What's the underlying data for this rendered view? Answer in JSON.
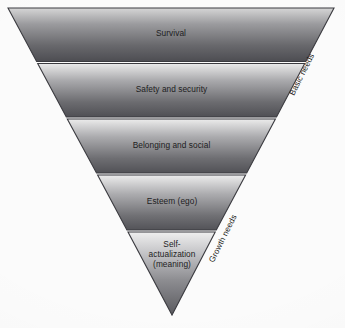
{
  "diagram": {
    "name": "inverted-hierarchy-of-needs",
    "type": "inverted-triangle-pyramid",
    "background_color": "#fbfbfb",
    "outline_color": "#3b3b40",
    "label_color": "#1d1d22",
    "band_gradient_light": "#ebebeb",
    "band_gradient_dark": "#4a4a4f",
    "bands": [
      {
        "id": "survival",
        "label": "Survival",
        "level": 1,
        "group": "Basic needs",
        "lines": [
          "Survival"
        ]
      },
      {
        "id": "safety-and-security",
        "label": "Safety and security",
        "level": 2,
        "group": "Basic needs",
        "lines": [
          "Safety and security"
        ]
      },
      {
        "id": "belonging-and-social",
        "label": "Belonging and social",
        "level": 3,
        "group": "Basic needs",
        "lines": [
          "Belonging and social"
        ]
      },
      {
        "id": "esteem-ego",
        "label": "Esteem (ego)",
        "level": 4,
        "group": "Growth needs",
        "lines": [
          "Esteem (ego)"
        ]
      },
      {
        "id": "self-actualization",
        "label": "Self-actualization (meaning)",
        "level": 5,
        "group": "Growth needs",
        "lines": [
          "Self-",
          "actualization",
          "(meaning)"
        ]
      }
    ],
    "edge_captions": [
      {
        "id": "basic-needs",
        "label": "Basic needs",
        "covers_levels": [
          1,
          2,
          3
        ]
      },
      {
        "id": "growth-needs",
        "label": "Growth needs",
        "covers_levels": [
          4,
          5
        ]
      }
    ]
  }
}
